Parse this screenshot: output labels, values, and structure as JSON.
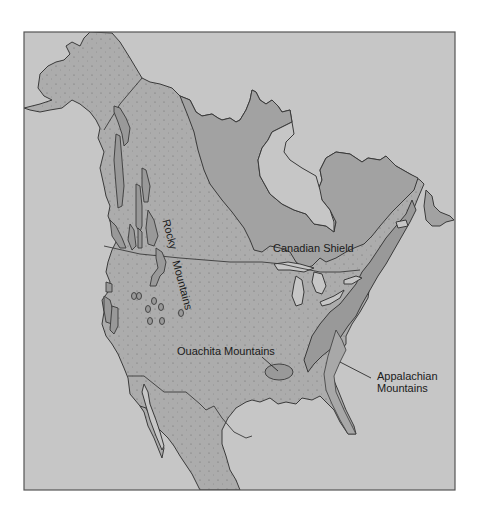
{
  "map": {
    "subject": "North America physiographic regions",
    "colors": {
      "frame_border": "#555555",
      "water": "#c6c6c6",
      "lowland": "#acacac",
      "shield": "#a2a2a2",
      "mountains": "#999999",
      "outline": "#3a3a3a",
      "label_text": "#1a1a1a"
    },
    "labels": {
      "rocky_1": "Rocky",
      "rocky_2": "Mountains",
      "canadian_shield": "Canadian Shield",
      "ouachita": "Ouachita Mountains",
      "appalachian_1": "Appalachian",
      "appalachian_2": "Mountains"
    },
    "regions": [
      {
        "name": "Rocky Mountains",
        "type": "mountain ranges (west)"
      },
      {
        "name": "Canadian Shield",
        "type": "shield"
      },
      {
        "name": "Ouachita Mountains",
        "type": "mountain range"
      },
      {
        "name": "Appalachian Mountains",
        "type": "mountain range (east)"
      }
    ]
  }
}
